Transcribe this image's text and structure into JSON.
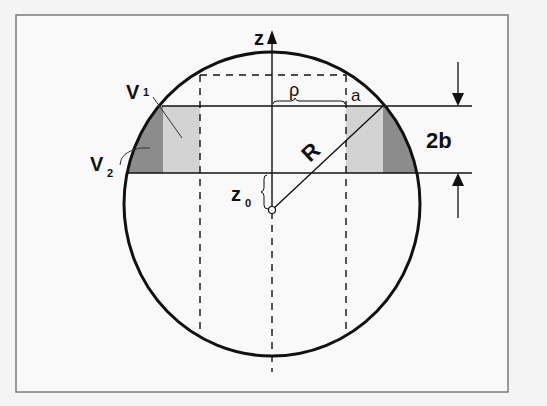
{
  "figure": {
    "labels": {
      "z_axis": "z",
      "rho": "ρ",
      "a": "a",
      "R": "R",
      "two_b": "2b",
      "z0_main": "z",
      "z0_sub": "0",
      "v1_main": "V",
      "v1_sub": "1",
      "v2_main": "V",
      "v2_sub": "2"
    },
    "colors": {
      "frame": "#777777",
      "outline": "#111111",
      "light_fill": "#d4d4d4",
      "dark_fill": "#8a8a8a",
      "background": "#f7f7f7"
    }
  }
}
